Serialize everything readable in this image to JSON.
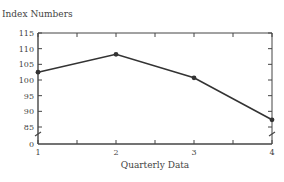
{
  "chart_data": {
    "type": "line",
    "title": "",
    "ylabel": "Index Numbers",
    "xlabel": "Quarterly Data",
    "categories": [
      "1",
      "2",
      "3",
      "4"
    ],
    "x": [
      1,
      2,
      3,
      4
    ],
    "series": [
      {
        "name": "Index Numbers",
        "values": [
          102.5,
          108.2,
          100.7,
          87.3
        ]
      }
    ],
    "yticks": [
      "0",
      "85",
      "90",
      "95",
      "100",
      "105",
      "110",
      "115"
    ],
    "ylim": [
      80,
      115
    ],
    "axis_break": {
      "between": [
        "0",
        "85"
      ]
    },
    "xticks": [
      "1",
      "2",
      "3",
      "4"
    ],
    "minor_xticks": [
      1.5,
      2.5,
      3.5
    ],
    "grid": false,
    "legend": null,
    "frame": "box",
    "colors": {
      "line": "#333333",
      "axes": "#444444"
    }
  },
  "labels": {
    "y_axis_title": "Index Numbers",
    "x_axis_title": "Quarterly Data"
  }
}
